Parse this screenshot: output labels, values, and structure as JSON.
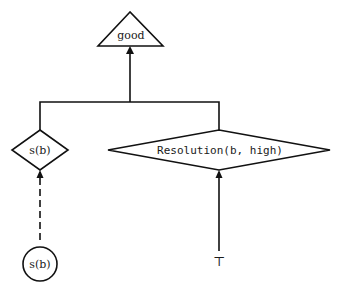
{
  "diagram": {
    "nodes": [
      {
        "id": "goal",
        "shape": "triangle",
        "label": "good"
      },
      {
        "id": "sb_diamond",
        "shape": "diamond",
        "label": "s(b)"
      },
      {
        "id": "resolution",
        "shape": "diamond",
        "label": "Resolution(b, high)"
      },
      {
        "id": "sb_circle",
        "shape": "circle",
        "label": "s(b)"
      },
      {
        "id": "top",
        "shape": "symbol",
        "label": "⊤"
      }
    ],
    "edges": [
      {
        "from": "sb_diamond",
        "to": "goal",
        "style": "solid",
        "arrow": true
      },
      {
        "from": "resolution",
        "to": "goal",
        "style": "solid",
        "arrow": true
      },
      {
        "from": "sb_circle",
        "to": "sb_diamond",
        "style": "dashed",
        "arrow": true
      },
      {
        "from": "top",
        "to": "resolution",
        "style": "solid",
        "arrow": true
      }
    ],
    "colors": {
      "stroke": "#111111",
      "background": "#ffffff"
    }
  }
}
